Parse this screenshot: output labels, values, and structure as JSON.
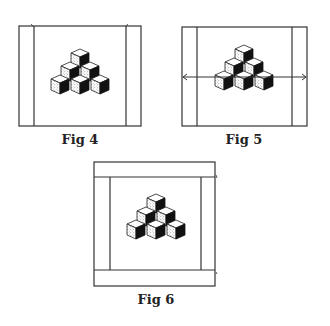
{
  "figures": [
    {
      "id": "fig4",
      "label": "Fig 4",
      "description": "Cube pyramid inside frame with two vertical inner strips"
    },
    {
      "id": "fig5",
      "label": "Fig 5",
      "description": "Cube pyramid inside frame with two vertical inner strips and a horizontal double-headed arrow"
    },
    {
      "id": "fig6",
      "label": "Fig 6",
      "description": "Cube pyramid inside frame with vertical strips and top/bottom horizontal bands"
    }
  ],
  "pyramid": {
    "rows": [
      1,
      2,
      3
    ],
    "cube_count": 6
  },
  "colors": {
    "line": "#333333",
    "dark_face": "#111111",
    "stipple": "#555555",
    "background": "#ffffff"
  }
}
